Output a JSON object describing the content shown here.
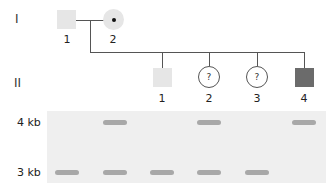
{
  "generations": [
    {
      "label": "I"
    },
    {
      "label": "II"
    }
  ],
  "gen1": [
    {
      "id": "1",
      "sex": "male",
      "fill": "#e6e6e6",
      "marker": ""
    },
    {
      "id": "2",
      "sex": "female",
      "fill": "#e6e6e6",
      "marker": "•"
    }
  ],
  "gen2": [
    {
      "id": "1",
      "sex": "male",
      "fill": "#e6e6e6",
      "marker": ""
    },
    {
      "id": "2",
      "sex": "female",
      "fill": "#ffffff",
      "marker": "?"
    },
    {
      "id": "3",
      "sex": "female",
      "fill": "#ffffff",
      "marker": "?"
    },
    {
      "id": "4",
      "sex": "male",
      "fill": "#6b6b6b",
      "marker": ""
    }
  ],
  "gel": {
    "size_labels": [
      "4 kb",
      "3 kb"
    ],
    "lanes": [
      {
        "lane": 1,
        "individual": "I-1",
        "bands": [
          "3 kb"
        ]
      },
      {
        "lane": 2,
        "individual": "I-2",
        "bands": [
          "4 kb",
          "3 kb"
        ]
      },
      {
        "lane": 3,
        "individual": "II-1",
        "bands": [
          "3 kb"
        ]
      },
      {
        "lane": 4,
        "individual": "II-2",
        "bands": [
          "4 kb",
          "3 kb"
        ]
      },
      {
        "lane": 5,
        "individual": "II-3",
        "bands": [
          "3 kb"
        ]
      },
      {
        "lane": 6,
        "individual": "II-4",
        "bands": [
          "4 kb"
        ]
      }
    ]
  },
  "colors": {
    "unaffected_fill": "#e6e6e6",
    "affected_fill": "#6b6b6b",
    "gel_bg": "#efefef",
    "band": "#a8a8a8"
  }
}
